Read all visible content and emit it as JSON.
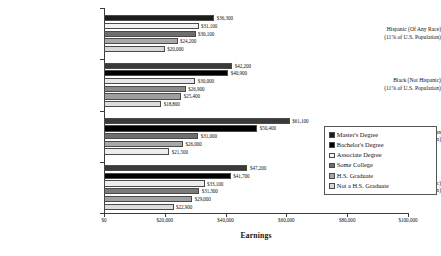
{
  "chart_data": {
    "type": "bar",
    "orientation": "horizontal",
    "title": "",
    "xlabel": "Earnings",
    "ylabel": "",
    "xlim": [
      0,
      100000
    ],
    "xticks": [
      0,
      20000,
      40000,
      60000,
      80000,
      100000
    ],
    "xtick_labels": [
      "$0",
      "$20,000",
      "$40,000",
      "$60,000",
      "$80,000",
      "$100,000"
    ],
    "grid": false,
    "legend_position": "right",
    "legend_entries": [
      "Master's Degree",
      "Bachelor's Degree",
      "Associate Degree",
      "Some College",
      "H.S. Graduate",
      "Not a H.S. Graduate"
    ],
    "series_colors": {
      "Master's Degree": "#1c1c1c",
      "Bachelor's Degree": "#000000",
      "Associate Degree": "#f2f2f2",
      "Some College": "#6e6e6e",
      "H.S. Graduate": "#a8a8a8",
      "Not a H.S. Graduate": "#d8d8d8"
    },
    "categories": [
      "Hispanic (Of Any Race)",
      "Black (Not Hispanic)",
      "Asian American",
      "White (Not Hispanic)"
    ],
    "groups": [
      {
        "name": "Hispanic (Of Any Race)",
        "line1": "Hispanic (Of Any Race)",
        "line2": "(11% of U.S. Population)",
        "bars": [
          {
            "series": "Master's Degree",
            "value": 36300,
            "label": "$36,300",
            "color": "#1c1c1c"
          },
          {
            "series": "Associate Degree",
            "value": 31100,
            "label": "$31,100",
            "color": "#f2f2f2"
          },
          {
            "series": "Some College",
            "value": 30100,
            "label": "$30,100",
            "color": "#6e6e6e"
          },
          {
            "series": "H.S. Graduate",
            "value": 24200,
            "label": "$24,200",
            "color": "#a8a8a8"
          },
          {
            "series": "Not a H.S. Graduate",
            "value": 20000,
            "label": "$20,000",
            "color": "#d8d8d8"
          }
        ]
      },
      {
        "name": "Black (Not Hispanic)",
        "line1": "Black (Not Hispanic)",
        "line2": "(11% of U.S. Population)",
        "bars": [
          {
            "series": "Bachelor's Degree",
            "value": 42200,
            "label": "$42,200",
            "color": "#3a3a3a"
          },
          {
            "series": "Master's Degree",
            "value": 40900,
            "label": "$40,900",
            "color": "#000000"
          },
          {
            "series": "Associate Degree",
            "value": 30000,
            "label": "$30,000",
            "color": "#e8e8e8"
          },
          {
            "series": "Some College",
            "value": 26900,
            "label": "$26,900",
            "color": "#8a8a8a"
          },
          {
            "series": "H.S. Graduate",
            "value": 25400,
            "label": "$25,400",
            "color": "#9e9e9e"
          },
          {
            "series": "Not a H.S. Graduate",
            "value": 18800,
            "label": "$18,800",
            "color": "#dcdcdc"
          }
        ]
      },
      {
        "name": "Asian American",
        "line1": "Asian American",
        "line2": "(3% of U.S. Population)",
        "bars": [
          {
            "series": "Bachelor's Degree",
            "value": 61100,
            "label": "$61,100",
            "color": "#3a3a3a"
          },
          {
            "series": "Master's Degree",
            "value": 50400,
            "label": "$50,400",
            "color": "#000000"
          },
          {
            "series": "Some College",
            "value": 31000,
            "label": "$31,000",
            "color": "#6e6e6e"
          },
          {
            "series": "H.S. Graduate",
            "value": 26000,
            "label": "$26,000",
            "color": "#a8a8a8"
          },
          {
            "series": "Not a H.S. Graduate",
            "value": 21500,
            "label": "$21,500",
            "color": "#ededed"
          }
        ]
      },
      {
        "name": "White (Not Hispanic)",
        "line1": "White (Not Hispanic)",
        "line2": "(73% of U.S. Population)",
        "bars": [
          {
            "series": "Bachelor's Degree",
            "value": 47200,
            "label": "$47,200",
            "color": "#3a3a3a"
          },
          {
            "series": "Master's Degree",
            "value": 41700,
            "label": "$41,700",
            "color": "#000000"
          },
          {
            "series": "Associate Degree",
            "value": 33100,
            "label": "$33,100",
            "color": "#ededed"
          },
          {
            "series": "Some College",
            "value": 31300,
            "label": "$31,300",
            "color": "#7a7a7a"
          },
          {
            "series": "H.S. Graduate",
            "value": 29000,
            "label": "$29,000",
            "color": "#a0a0a0"
          },
          {
            "series": "Not a H.S. Graduate",
            "value": 22900,
            "label": "$22,900",
            "color": "#dcdcdc"
          }
        ]
      }
    ]
  }
}
